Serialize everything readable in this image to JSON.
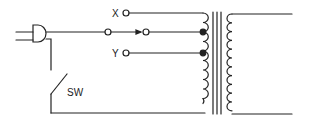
{
  "diagram": {
    "type": "circuit-schematic",
    "labels": {
      "tap_x": "X",
      "tap_y": "Y",
      "switch": "SW"
    },
    "components": [
      {
        "id": "plug",
        "kind": "power-plug"
      },
      {
        "id": "switch",
        "kind": "single-pole-switch",
        "label": "SW"
      },
      {
        "id": "selector",
        "kind": "tap-selector",
        "terminals": [
          "X",
          "Y"
        ]
      },
      {
        "id": "transformer",
        "kind": "transformer-iron-core",
        "primary_taps": 2
      }
    ],
    "colors": {
      "line": "#222222",
      "background": "#ffffff"
    }
  }
}
